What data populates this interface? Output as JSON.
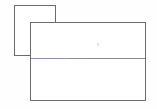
{
  "scene": {
    "description": "Two overlapping blank rectangular windows on a white background",
    "background_color": "#fefefe",
    "border_color": "#6b6b6b"
  },
  "back_window": {
    "name": "background-window",
    "fill_color": "#ffffff",
    "border_color": "#6b6b6b",
    "x": 14,
    "y": 5,
    "width": 42,
    "height": 51,
    "content": ""
  },
  "front_window": {
    "name": "foreground-window",
    "fill_color": "#ffffff",
    "border_color": "#6b6b6b",
    "x": 30,
    "y": 22,
    "width": 116,
    "height": 79,
    "upper_pane": {
      "label": "",
      "content": ""
    },
    "lower_pane": {
      "label": "",
      "content": ""
    },
    "divider": {
      "name": "horizontal-divider",
      "y_offset": 35,
      "accent_color": "#8a8ad0",
      "neutral_color": "#8a8a8a",
      "accent_width": 34
    },
    "speck": {
      "name": "faint-mark",
      "color": "#e4e2d8",
      "x_offset": 66,
      "y_offset": 20
    }
  }
}
